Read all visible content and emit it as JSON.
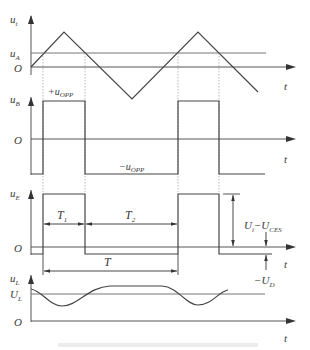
{
  "figure": {
    "type": "timing-waveform-diagram",
    "caption": "",
    "colors": {
      "line": "#444444",
      "reference": "#777777",
      "dashed": "#999999",
      "text": "#3a3a3a"
    }
  },
  "plots": {
    "ut": {
      "y_axis_label": "u",
      "y_axis_sub": "t",
      "ref_label": "u",
      "ref_sub": "A",
      "origin_label": "O",
      "x_axis_label": "t",
      "signal": "triangle"
    },
    "ub": {
      "y_axis_label": "u",
      "y_axis_sub": "B",
      "origin_label": "O",
      "x_axis_label": "t",
      "high_label": "+u",
      "high_sub": "OPP",
      "low_label": "−u",
      "low_sub": "OPP",
      "signal": "square"
    },
    "ue": {
      "y_axis_label": "u",
      "y_axis_sub": "E",
      "origin_label": "O",
      "x_axis_label": "t",
      "t1_label": "T",
      "t1_sub": "1",
      "t2_label": "T",
      "t2_sub": "2",
      "period_label": "T",
      "amplitude_label": "U",
      "amplitude_sub1": "i",
      "amplitude_mid": "−U",
      "amplitude_sub2": "CES",
      "negative_label": "−U",
      "negative_sub": "D",
      "signal": "pulse"
    },
    "ul": {
      "y_axis_label": "u",
      "y_axis_sub": "L",
      "ref_label": "U",
      "ref_sub": "L",
      "origin_label": "O",
      "x_axis_label": "t",
      "signal": "ripple"
    }
  }
}
